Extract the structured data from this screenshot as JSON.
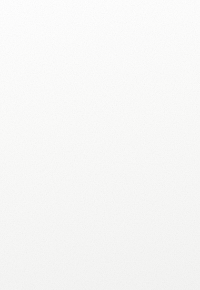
{
  "figure": {
    "type": "cladogram-diagram",
    "caption_absent": true,
    "background_color": "#fdfdfd",
    "clade_fill_color": "#9a9a9a",
    "silhouette_color": "#101010",
    "rule_color": "#8d8d8d",
    "bracket_color": "#8b8b8b"
  },
  "clades": [
    {
      "id": "crocodiles",
      "label": "ocodiles",
      "label_full_cropped": "Crocodiles",
      "silhouette": "crocodilian-silhouette",
      "truncated_at_left_edge": true
    },
    {
      "id": "pterosaurs",
      "label": "Pterosaurs",
      "silhouette": "pterosaur-silhouette",
      "truncated_at_left_edge": false
    },
    {
      "id": "dinosaurs",
      "label": "\"Dinosaurs\"",
      "silhouette": "stegosaurus-silhouette",
      "truncated_at_left_edge": false
    }
  ],
  "brackets": [
    {
      "id": "upper-dashed-bracket",
      "style": "dashed",
      "label": "",
      "spans": [
        "crocodiles",
        "pterosaurs",
        "dinosaurs"
      ]
    },
    {
      "id": "archosaurs-bracket",
      "style": "solid",
      "label": "\"Archosaurs\"",
      "spans": [
        "crocodiles",
        "pterosaurs",
        "dinosaurs"
      ]
    }
  ],
  "labels": {
    "crocodiles": "ocodiles",
    "pterosaurs": "Pterosaurs",
    "dinosaurs": "\"Dinosaurs\"",
    "archosaurs": "\"Archosaurs\""
  },
  "icons": {
    "crocodile": "crocodilian-silhouette-icon",
    "pterosaur": "pterosaur-silhouette-icon",
    "stegosaur": "stegosaurus-silhouette-icon"
  }
}
